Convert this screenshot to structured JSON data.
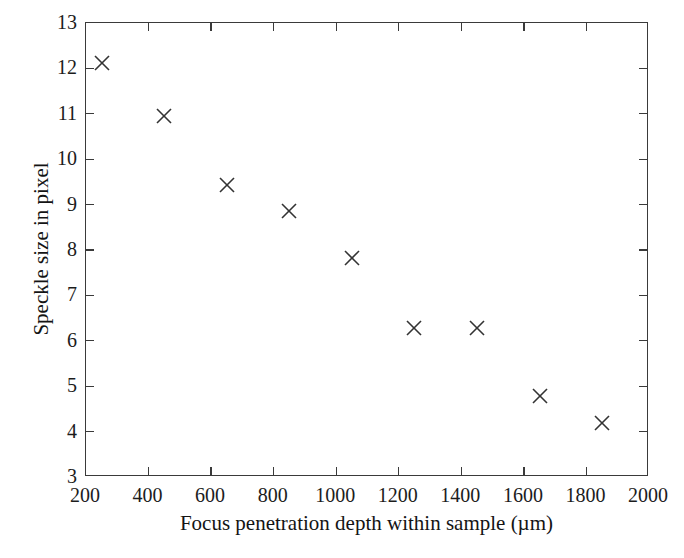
{
  "chart_data": {
    "type": "scatter",
    "title": "",
    "xlabel": "Focus penetration depth within sample (µm)",
    "ylabel": "Speckle size in pixel",
    "xlim": [
      200,
      2000
    ],
    "ylim": [
      3,
      13
    ],
    "grid": false,
    "legend": null,
    "marker": "x",
    "marker_color": "#333333",
    "x": [
      250,
      450,
      650,
      850,
      1050,
      1250,
      1450,
      1650,
      1850
    ],
    "y": [
      12.11,
      10.96,
      9.43,
      8.85,
      7.82,
      6.28,
      6.28,
      4.78,
      4.2
    ],
    "xticks": [
      200,
      400,
      600,
      800,
      1000,
      1200,
      1400,
      1600,
      1800,
      2000
    ],
    "yticks": [
      3,
      4,
      5,
      6,
      7,
      8,
      9,
      10,
      11,
      12,
      13
    ],
    "xtick_labels": [
      "200",
      "400",
      "600",
      "800",
      "1000",
      "1200",
      "1400",
      "1600",
      "1800",
      "2000"
    ],
    "ytick_labels": [
      "3",
      "4",
      "5",
      "6",
      "7",
      "8",
      "9",
      "10",
      "11",
      "12",
      "13"
    ],
    "points": [
      {
        "x": 250,
        "y": 12.11
      },
      {
        "x": 450,
        "y": 10.96
      },
      {
        "x": 650,
        "y": 9.43
      },
      {
        "x": 850,
        "y": 8.85
      },
      {
        "x": 1050,
        "y": 7.82
      },
      {
        "x": 1250,
        "y": 6.28
      },
      {
        "x": 1450,
        "y": 6.28
      },
      {
        "x": 1650,
        "y": 4.78
      },
      {
        "x": 1850,
        "y": 4.2
      }
    ]
  },
  "axes": {
    "x_title": "Focus penetration depth within sample (µm)",
    "y_title": "Speckle size in pixel"
  },
  "colors": {
    "frame": "#3a3a3a",
    "text": "#141414",
    "marker": "#333333",
    "background": "#ffffff"
  }
}
